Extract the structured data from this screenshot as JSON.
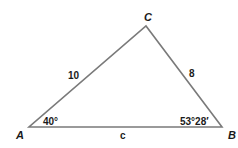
{
  "figure": {
    "type": "triangle",
    "stroke_color": "#7a7a7a",
    "text_color": "#1a1a1a",
    "vertices": [
      {
        "name": "A",
        "label": "A",
        "x": 29,
        "y": 127
      },
      {
        "name": "B",
        "label": "B",
        "x": 222,
        "y": 127
      },
      {
        "name": "C",
        "label": "C",
        "x": 146,
        "y": 26
      }
    ],
    "sides": {
      "AC": {
        "label": "10"
      },
      "BC": {
        "label": "8"
      },
      "AB": {
        "label": "c"
      }
    },
    "angles": {
      "A": {
        "label": "40°"
      },
      "B": {
        "label": "53°28′"
      }
    }
  }
}
